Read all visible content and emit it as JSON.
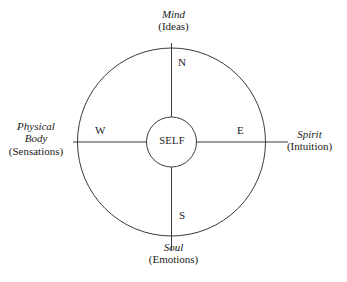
{
  "diagram": {
    "center": {
      "label": "SELF"
    },
    "cardinals": {
      "north": "N",
      "south": "S",
      "west": "W",
      "east": "E"
    },
    "quadrant_labels": [
      {
        "position": "top",
        "name": "Mind",
        "parenthetical": "(Ideas)",
        "cardinal": "N"
      },
      {
        "position": "right",
        "name": "Spirit",
        "parenthetical": "(Intuition)",
        "cardinal": "E"
      },
      {
        "position": "bottom",
        "name": "Soul",
        "parenthetical": "(Emotions)",
        "cardinal": "S"
      },
      {
        "position": "left",
        "name": "Physical Body",
        "name_line1": "Physical",
        "name_line2": "Body",
        "parenthetical": "(Sensations)",
        "cardinal": "W"
      }
    ],
    "geometry": {
      "outer_circle": {
        "cx": 171.5,
        "cy": 142,
        "r": 94
      },
      "inner_circle": {
        "cx": 171.5,
        "cy": 142,
        "r": 25
      },
      "horizontal_axis": {
        "x1": 73,
        "x2": 288,
        "y": 142
      },
      "vertical_axis": {
        "y1": 43,
        "y2": 250,
        "x": 171.5
      }
    },
    "colors": {
      "background": "#ffffff",
      "stroke": "#3a3a3a",
      "text": "#1b1b1b"
    }
  }
}
